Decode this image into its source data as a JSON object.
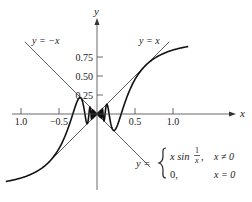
{
  "chart_data": {
    "type": "line",
    "title": "",
    "xlabel": "x",
    "ylabel": "y",
    "xlim": [
      -1.3,
      1.6
    ],
    "ylim": [
      -1.2,
      1.2
    ],
    "grid": false,
    "x_ticks": [
      {
        "value": -1.0,
        "label": "1.0"
      },
      {
        "value": -0.5,
        "label": "−0.5"
      },
      {
        "value": 0.5,
        "label": "0.5"
      },
      {
        "value": 1.0,
        "label": "1.0"
      }
    ],
    "y_ticks": [
      {
        "value": 0.25,
        "label": "0.25"
      },
      {
        "value": 0.5,
        "label": "0.50"
      },
      {
        "value": 0.75,
        "label": "0.75"
      }
    ],
    "series": [
      {
        "name": "x sin(1/x)",
        "expression": "y = x*sin(1/x)",
        "domain": [
          -1.2,
          1.2
        ],
        "style": "thick"
      },
      {
        "name": "y = x",
        "expression": "y = x",
        "domain": [
          -0.7,
          0.95
        ],
        "style": "thin"
      },
      {
        "name": "y = -x",
        "expression": "y = -x",
        "domain": [
          -0.95,
          0.7
        ],
        "style": "thin"
      }
    ],
    "annotations": [
      {
        "text": "y = −x",
        "position": "upper-left"
      },
      {
        "text": "y = x",
        "position": "upper-right"
      },
      {
        "text": "y = { x sin 1/x, x ≠ 0 ; 0, x = 0 }",
        "position": "lower-right"
      }
    ]
  },
  "labels": {
    "axis_x": "x",
    "axis_y": "y",
    "line_neg": "y = −x",
    "line_pos": "y = x",
    "piece_lhs": "y =",
    "piece1_expr": "x sin",
    "piece1_num": "1",
    "piece1_den": "x",
    "piece1_comma": ",",
    "piece1_cond": "x ≠ 0",
    "piece2_expr": "0,",
    "piece2_cond": "x = 0"
  }
}
